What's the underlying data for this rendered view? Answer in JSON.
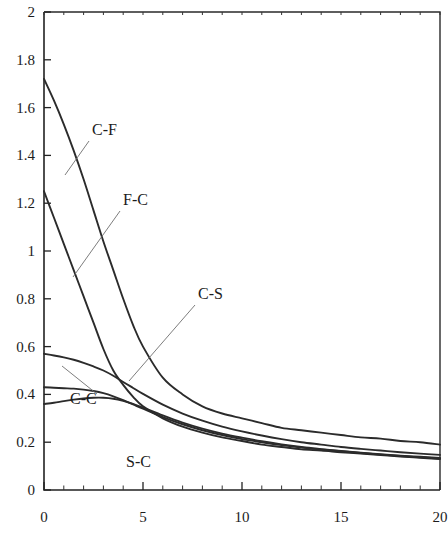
{
  "chart_data": {
    "type": "line",
    "title": "",
    "subtitle": "",
    "xlabel": "",
    "ylabel": "",
    "xlim": [
      0,
      20
    ],
    "ylim": [
      0,
      2
    ],
    "grid": false,
    "legend_position": "inline-annotations",
    "x_ticks": [
      0,
      5,
      10,
      15,
      20
    ],
    "x_tick_labels": [
      "0",
      "5",
      "10",
      "15",
      "20"
    ],
    "x_minor_tick_step": 1,
    "y_ticks": [
      0,
      0.2,
      0.4,
      0.6,
      0.8,
      1,
      1.2,
      1.4,
      1.6,
      1.8,
      2
    ],
    "y_tick_labels": [
      "0",
      "0.2",
      "0.4",
      "0.6",
      "0.8",
      "1",
      "1.2",
      "1.4",
      "1.6",
      "1.8",
      "2"
    ],
    "x": [
      0,
      0.5,
      1,
      1.5,
      2,
      2.5,
      3,
      3.5,
      4,
      4.5,
      5,
      6,
      7,
      8,
      9,
      10,
      11,
      12,
      13,
      14,
      15,
      16,
      17,
      18,
      19,
      20
    ],
    "series": [
      {
        "name": "C-F",
        "label": "C-F",
        "values": [
          1.72,
          1.63,
          1.53,
          1.42,
          1.3,
          1.17,
          1.04,
          0.92,
          0.8,
          0.69,
          0.6,
          0.47,
          0.4,
          0.35,
          0.32,
          0.3,
          0.28,
          0.26,
          0.25,
          0.24,
          0.23,
          0.22,
          0.215,
          0.205,
          0.2,
          0.19
        ]
      },
      {
        "name": "F-C",
        "label": "F-C",
        "values": [
          1.25,
          1.14,
          1.03,
          0.92,
          0.81,
          0.7,
          0.59,
          0.5,
          0.44,
          0.39,
          0.35,
          0.3,
          0.265,
          0.24,
          0.22,
          0.205,
          0.19,
          0.18,
          0.17,
          0.165,
          0.158,
          0.152,
          0.146,
          0.14,
          0.135,
          0.13
        ]
      },
      {
        "name": "C-S",
        "label": "C-S",
        "values": [
          0.57,
          0.563,
          0.555,
          0.545,
          0.532,
          0.517,
          0.5,
          0.478,
          0.452,
          0.427,
          0.402,
          0.357,
          0.32,
          0.29,
          0.265,
          0.245,
          0.228,
          0.213,
          0.2,
          0.19,
          0.18,
          0.172,
          0.165,
          0.158,
          0.152,
          0.147
        ]
      },
      {
        "name": "C-C",
        "label": "C-C",
        "values": [
          0.43,
          0.428,
          0.426,
          0.424,
          0.42,
          0.414,
          0.405,
          0.392,
          0.376,
          0.358,
          0.34,
          0.305,
          0.275,
          0.25,
          0.23,
          0.213,
          0.2,
          0.188,
          0.178,
          0.17,
          0.162,
          0.155,
          0.148,
          0.142,
          0.137,
          0.132
        ]
      },
      {
        "name": "S-C",
        "label": "S-C",
        "values": [
          0.36,
          0.365,
          0.372,
          0.378,
          0.383,
          0.386,
          0.386,
          0.382,
          0.373,
          0.36,
          0.345,
          0.312,
          0.282,
          0.257,
          0.236,
          0.219,
          0.204,
          0.191,
          0.18,
          0.171,
          0.163,
          0.156,
          0.15,
          0.144,
          0.139,
          0.134
        ]
      }
    ],
    "annotations": [
      {
        "text": "C-F",
        "label_x": 92,
        "label_y": 135,
        "leader_from_x": 89,
        "leader_from_y": 141,
        "leader_to_x": 65,
        "leader_to_y": 175
      },
      {
        "text": "F-C",
        "label_x": 123,
        "label_y": 205,
        "leader_from_x": 120,
        "leader_from_y": 211,
        "leader_to_x": 73,
        "leader_to_y": 277
      },
      {
        "text": "C-S",
        "label_x": 198,
        "label_y": 299,
        "leader_from_x": 195,
        "leader_from_y": 305,
        "leader_to_x": 129,
        "leader_to_y": 381
      },
      {
        "text": "C-C",
        "label_x": 70,
        "label_y": 404,
        "leader_from_x": 97,
        "leader_from_y": 394,
        "leader_to_x": 62,
        "leader_to_y": 366
      },
      {
        "text": "S-C",
        "label_x": 126,
        "label_y": 467,
        "leader_from_x": 0,
        "leader_from_y": 0,
        "leader_to_x": 0,
        "leader_to_y": 0
      }
    ]
  },
  "plot_geometry": {
    "left": 44,
    "right": 440,
    "top": 12,
    "bottom": 490
  },
  "colors": {
    "background": "#ffffff",
    "curve": "#2b2b2b",
    "axis": "#222222",
    "text": "#1c1c1c",
    "leader": "#6e6e6e"
  }
}
